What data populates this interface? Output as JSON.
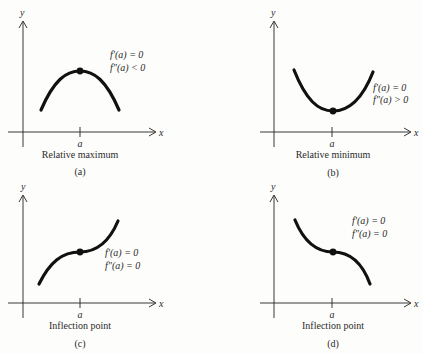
{
  "colors": {
    "ink": "#111111",
    "text": "#2a2a2a",
    "background": "#fdfdfb"
  },
  "panels": [
    {
      "id": "a",
      "caption": "Relative maximum",
      "tag": "(a)",
      "x_label": "x",
      "y_label": "y",
      "tick_label": "a",
      "conditions": [
        "f′(a) = 0",
        "f″(a) < 0"
      ]
    },
    {
      "id": "b",
      "caption": "Relative minimum",
      "tag": "(b)",
      "x_label": "x",
      "y_label": "y",
      "tick_label": "a",
      "conditions": [
        "f′(a) = 0",
        "f″(a) > 0"
      ]
    },
    {
      "id": "c",
      "caption": "Inflection point",
      "tag": "(c)",
      "x_label": "x",
      "y_label": "y",
      "tick_label": "a",
      "conditions": [
        "f′(a) = 0",
        "f″(a) = 0"
      ]
    },
    {
      "id": "d",
      "caption": "Inflection point",
      "tag": "(d)",
      "x_label": "x",
      "y_label": "y",
      "tick_label": "a",
      "conditions": [
        "f′(a) = 0",
        "f″(a) = 0"
      ]
    }
  ]
}
